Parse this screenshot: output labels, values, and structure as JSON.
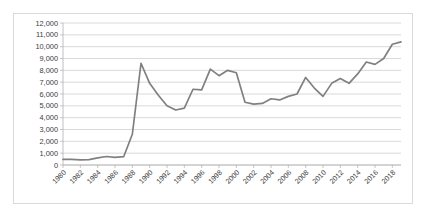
{
  "chart_data": {
    "type": "line",
    "title": "",
    "subtitle": "",
    "xlabel": "",
    "ylabel": "",
    "grid": "horizontal",
    "legend": "none",
    "line_color": "#808080",
    "gridline_color": "#c8c8c8",
    "axis_color": "#b0b0b0",
    "background_color": "#ffffff",
    "border_color": "#d9d9d9",
    "ylim": [
      0,
      12000
    ],
    "ytick_step": 1000,
    "ytick_labels": [
      "12,000",
      "11,000",
      "10,000",
      "9,000",
      "8,000",
      "7,000",
      "6,000",
      "5,000",
      "4,000",
      "3,000",
      "2,000",
      "1,000",
      "0"
    ],
    "ytick_values": [
      12000,
      11000,
      10000,
      9000,
      8000,
      7000,
      6000,
      5000,
      4000,
      3000,
      2000,
      1000,
      0
    ],
    "xlim": [
      1980,
      2019
    ],
    "xtick_step": 2,
    "xtick_labels": [
      "1980",
      "1982",
      "1984",
      "1986",
      "1988",
      "1990",
      "1992",
      "1994",
      "1996",
      "1998",
      "2000",
      "2002",
      "2004",
      "2006",
      "2008",
      "2010",
      "2012",
      "2014",
      "2016",
      "2018"
    ],
    "xtick_rotation_degrees": -45,
    "x": [
      1980,
      1981,
      1982,
      1983,
      1984,
      1985,
      1986,
      1987,
      1988,
      1989,
      1990,
      1991,
      1992,
      1993,
      1994,
      1995,
      1996,
      1997,
      1998,
      1999,
      2000,
      2001,
      2002,
      2003,
      2004,
      2005,
      2006,
      2007,
      2008,
      2009,
      2010,
      2011,
      2012,
      2013,
      2014,
      2015,
      2016,
      2017,
      2018,
      2019
    ],
    "series": [
      {
        "name": "Series 1",
        "color": "#808080",
        "values": [
          480,
          470,
          430,
          450,
          600,
          720,
          640,
          700,
          2600,
          8600,
          6900,
          5900,
          5000,
          4650,
          4800,
          6400,
          6350,
          8100,
          7550,
          8000,
          7800,
          5300,
          5150,
          5200,
          5600,
          5500,
          5800,
          6000,
          7400,
          6500,
          5800,
          6900,
          7300,
          6900,
          7700,
          8700,
          8500,
          9000,
          10200,
          10400
        ]
      }
    ]
  }
}
